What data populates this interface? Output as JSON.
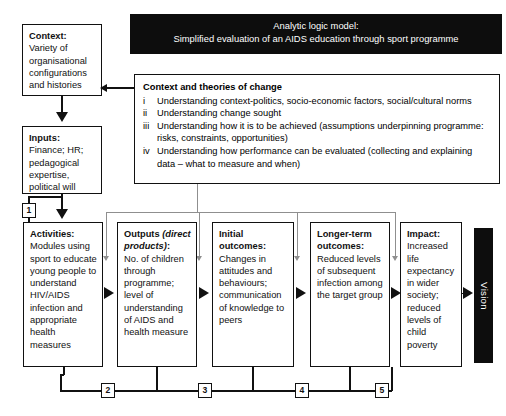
{
  "banner": {
    "line1": "Analytic logic model:",
    "line2": "Simplified evaluation of an AIDS education through sport programme"
  },
  "context_box": {
    "heading": "Context:",
    "body": "Variety of organisational configurations and histories"
  },
  "inputs_box": {
    "heading": "Inputs:",
    "body": "Finance; HR; pedagogical expertise, political will"
  },
  "theories": {
    "title": "Context and theories of change",
    "items": [
      {
        "num": "i",
        "text": "Understanding context-politics, socio-economic factors, social/cultural norms"
      },
      {
        "num": "ii",
        "text": "Understanding change sought"
      },
      {
        "num": "iii",
        "text": "Understanding how it is to be achieved (assumptions underpinning programme: risks, constraints, opportunities)"
      },
      {
        "num": "iv",
        "text": "Understanding how performance can be evaluated (collecting and explaining data – what to measure and when)"
      }
    ]
  },
  "chain": {
    "activities": {
      "heading": "Activities:",
      "body": "Modules using sport to educate young people to understand HIV/AIDS infection and appropriate health measures"
    },
    "outputs": {
      "heading_pre": "Outputs",
      "heading_italic": "(direct products)",
      "heading_post": ":",
      "body": "No. of children through programme; level of understanding of AIDS and health measure"
    },
    "initial_outcomes": {
      "heading": "Initial outcomes:",
      "body": "Changes in attitudes and behaviours; communication of knowledge to peers"
    },
    "longer_term_outcomes": {
      "heading": "Longer-term outcomes:",
      "body": "Reduced levels of subsequent infection among the target group"
    },
    "impact": {
      "heading": "Impact:",
      "body": "Increased life expectancy in wider society; reduced levels of child poverty"
    }
  },
  "vision": {
    "label": "Vision"
  },
  "tags": {
    "t1": "1",
    "t2": "2",
    "t3": "3",
    "t4": "4",
    "t5": "5"
  },
  "colors": {
    "ink": "#111111",
    "banner_bg": "#0d0d0d",
    "banner_text": "#ffffff",
    "feedback_line": "#8f8f8f",
    "page_bg": "#ffffff"
  }
}
